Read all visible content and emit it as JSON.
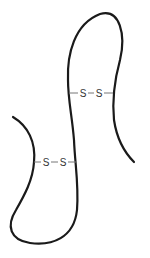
{
  "diagram": {
    "type": "polypeptide-chain-with-disulfide-bonds",
    "colors": {
      "chain": "#1a1a1a",
      "bond": "#777777",
      "label": "#333333",
      "background": "#ffffff"
    },
    "disulfide_bonds": [
      {
        "id": "upper",
        "left_atom": "S",
        "right_atom": "S"
      },
      {
        "id": "lower",
        "left_atom": "S",
        "right_atom": "S"
      }
    ]
  }
}
